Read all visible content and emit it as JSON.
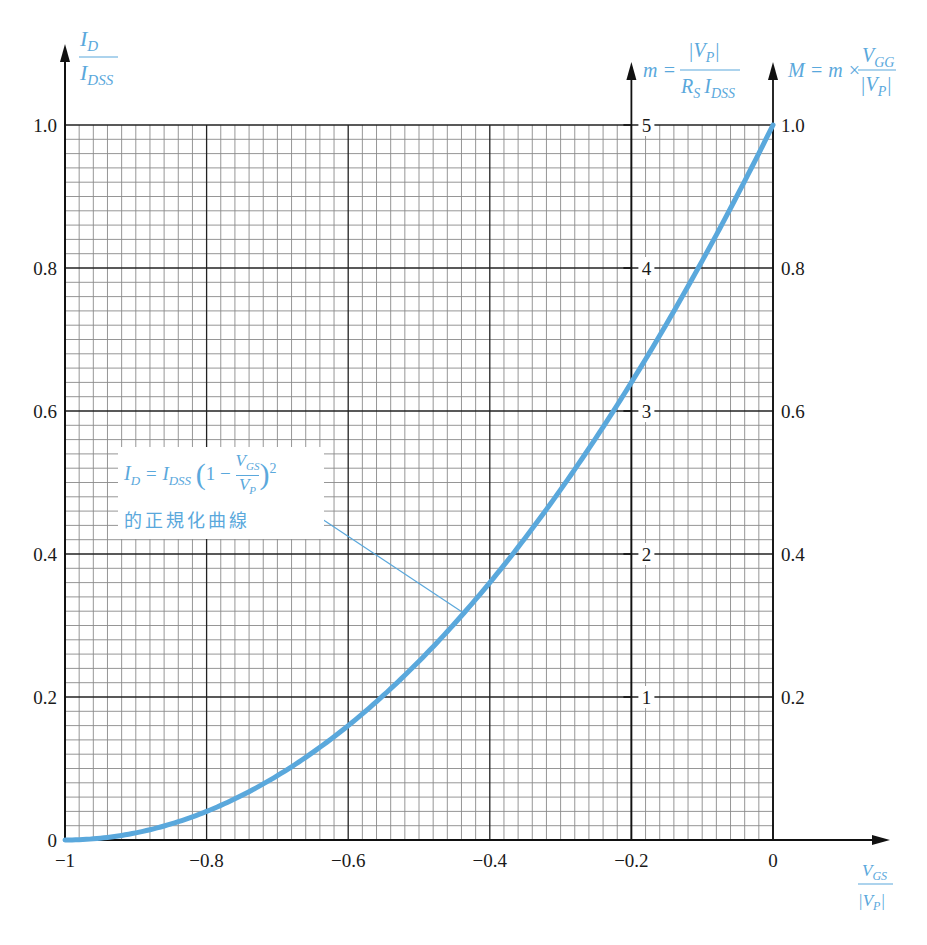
{
  "chart_data": {
    "type": "line",
    "title": "",
    "series": [
      {
        "name": "I_D = I_DSS (1 - V_GS/V_P)^2 normalized curve",
        "x": [
          -1.0,
          -0.9,
          -0.8,
          -0.7,
          -0.6,
          -0.5,
          -0.4,
          -0.3,
          -0.2,
          -0.1,
          0.0
        ],
        "values": [
          0.0,
          0.01,
          0.04,
          0.09,
          0.16,
          0.25,
          0.36,
          0.49,
          0.64,
          0.81,
          1.0
        ],
        "color": "#5aa8dc"
      }
    ],
    "xlabel": "V_GS / |V_P|",
    "ylabel": "I_D / I_DSS",
    "xlim": [
      -1.0,
      0.0
    ],
    "ylim": [
      0.0,
      1.0
    ],
    "x_ticks": [
      "-1",
      "-0.8",
      "-0.6",
      "-0.4",
      "-0.2",
      "0"
    ],
    "y_ticks_left": [
      "0",
      "0.2",
      "0.4",
      "0.6",
      "0.8",
      "1.0"
    ],
    "secondary_axes": [
      {
        "position": "x = -0.2",
        "label": "m = |V_P| / (R_S I_DSS)",
        "ticks": [
          "1",
          "2",
          "3",
          "4",
          "5"
        ],
        "range": [
          0,
          5
        ]
      },
      {
        "position": "x = 0 (right)",
        "label": "M = m × V_GG / |V_P|",
        "ticks": [
          "0.2",
          "0.4",
          "0.6",
          "0.8",
          "1.0"
        ],
        "range": [
          0,
          1.0
        ]
      }
    ],
    "grid": true,
    "grid_minor_step": 0.02,
    "grid_major_step": 0.2,
    "annotation": {
      "formula": "I_D = I_DSS (1 − V_GS / V_P)^2",
      "caption": "的正規化曲線",
      "points_to": [
        -0.44,
        0.31
      ]
    },
    "legend": "none"
  },
  "labels": {
    "y_left_num": "I",
    "y_left_num_sub": "D",
    "y_left_den": "I",
    "y_left_den_sub": "DSS",
    "m_prefix": "m =",
    "m_num": "|V",
    "m_num_sub": "P",
    "m_num_end": "|",
    "m_den": "R",
    "m_den_sub": "S",
    "m_den2": "I",
    "m_den2_sub": "DSS",
    "M_prefix": "M = m ×",
    "M_num": "V",
    "M_num_sub": "GG",
    "M_den": "|V",
    "M_den_sub": "P",
    "M_den_end": "|",
    "x_num": "V",
    "x_num_sub": "GS",
    "x_den": "|V",
    "x_den_sub": "P",
    "x_den_end": "|"
  },
  "annotation": {
    "formula_html": "I_D = I_DSS (1 − V_GS/V_P)²",
    "caption": "的正規化曲線"
  },
  "colors": {
    "curve": "#5aa8dc",
    "grid_minor": "#8a8a8a",
    "grid_major": "#222222",
    "axis": "#111111",
    "label_blue": "#5aa8dc"
  }
}
